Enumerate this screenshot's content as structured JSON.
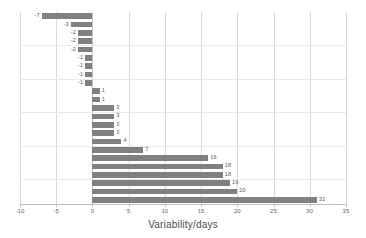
{
  "chart_data": {
    "type": "bar",
    "orientation": "horizontal",
    "title": "",
    "xlabel": "Variability/days",
    "ylabel": "",
    "xlim": [
      -10,
      35
    ],
    "xticks": [
      -10,
      -5,
      0,
      5,
      10,
      15,
      20,
      25,
      30,
      35
    ],
    "xtick_labels": [
      "-10",
      "-5",
      "0",
      "5",
      "10",
      "15",
      "20",
      "25",
      "30",
      "35"
    ],
    "ytick_labels": [],
    "grid": "vertical-major-horizontal-minor",
    "legend": "none",
    "bar_color": "#808080",
    "data_labels_shown": true,
    "categories": [
      "b1",
      "b2",
      "b3",
      "b4",
      "b5",
      "b6",
      "b7",
      "b8",
      "b9",
      "b10",
      "b11",
      "b12",
      "b13",
      "b14",
      "b15",
      "b16",
      "b17",
      "b18",
      "b19",
      "b20",
      "b21",
      "b22",
      "b23"
    ],
    "values": [
      -7,
      -3,
      -2,
      -2,
      -2,
      -1,
      -1,
      -1,
      -1,
      1,
      1,
      3,
      3,
      3,
      3,
      4,
      7,
      16,
      18,
      18,
      19,
      20,
      31
    ],
    "value_labels": [
      "-7",
      "-3",
      "-2",
      "-2",
      "-2",
      "-1",
      "-1",
      "-1",
      "-1",
      "1",
      "1",
      "3",
      "3",
      "3",
      "3",
      "4",
      "7",
      "16",
      "18",
      "18",
      "19",
      "20",
      "31"
    ],
    "n_bars": 23,
    "n_negative": 9,
    "n_positive": 14
  },
  "axis": {
    "x_title": "Variability/days"
  }
}
